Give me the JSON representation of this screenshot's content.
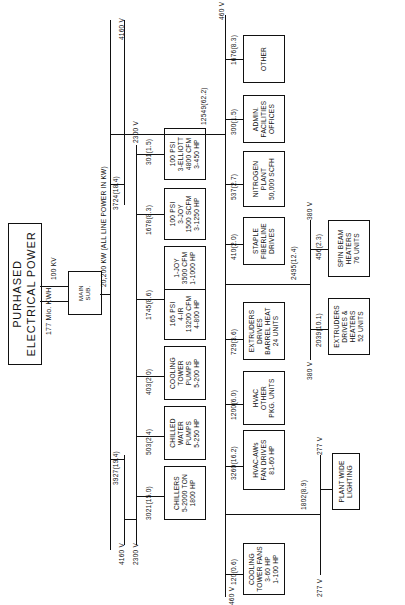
{
  "title": "PURHASED ELECTRICAL POWER",
  "subtitle": "177 Mio. KWH",
  "supply_voltage": "100 KV",
  "main_sub": "MAIN\nSUB.",
  "bus_label": "20,200 KW (ALL LINE POWER IN KW)",
  "voltages": {
    "v4160_top": "4160 V",
    "v4160_bottom": "4160 V",
    "v2300_left": "2300 V",
    "v2300_right": "2300 V",
    "v460_top": "460 V",
    "v460_bottom": "460 V",
    "v380_top": "380 V",
    "v380_bottom": "380 V",
    "v277_left": "277 V",
    "v277_right": "277 V"
  },
  "branch_4160": {
    "left": {
      "label": "3927(19.4)",
      "loads": [
        {
          "value": "3021(15.0)",
          "box": "CHILLERS\n5-2000 TON\n1800 HP"
        },
        {
          "value": "503(2.4)",
          "box": "CHILLED\nWATER\nPUMPS\n5-250 HP"
        },
        {
          "value": "403(2.0)",
          "box": "COOLING\nTOWER\nPUMPS\n5-200 HP"
        }
      ]
    },
    "right": {
      "label": "3724(18.4)",
      "loads": [
        {
          "value": "1745(8.6)",
          "box": "165 PSI\n4-IR\n13200 CFM\n4-800 HP",
          "box2": "1-JOY\n3500 CFM\n1-1000 HP"
        },
        {
          "value": "1678(8.3)",
          "box": "100 PSI\n3-JOY\n1500 SCFM\n3-1250 HP"
        },
        {
          "value": "301(1.5)",
          "box": "100 PSI\n3-ELLIOTT\n4800 CFM\n3-450 HP"
        }
      ]
    }
  },
  "branch_460": {
    "label": "12549(62.2)",
    "loads": [
      {
        "value": "120(0.6)",
        "box": "COOLING\nTOWER FANS\n3-60 HP\n1-100 HP"
      },
      {
        "value": "3260(16.2)",
        "box": "HVAC-AWs\nFAN DRIVES\n81-60 HP"
      },
      {
        "value": "1200(6.0)",
        "box": "HVAC\nOTHER\nPKG. UNITS"
      },
      {
        "value": "729(3.6)",
        "box": "EXTRUDERS\nDRIVES\nBARREL HEAT\n24 UNITS"
      },
      {
        "value": "410(2.0)",
        "box": "STAPLE\nFIBERLINE\nDRIVES"
      },
      {
        "value": "537(2.7)",
        "box": "NITROGEN\nPLANT\n50,000 SCFH"
      },
      {
        "value": "300(1.5)",
        "box": "ADMIN.\nFACILITIES\nOFFICES"
      },
      {
        "value": "1676(8.3)",
        "box": "OTHER"
      }
    ],
    "sub_277": {
      "value": "1802(8.9)",
      "box": "PLANT WIDE\nLIGHTING"
    },
    "sub_380": {
      "value": "2495(12.4)",
      "loads": [
        {
          "value": "2039(10.1)",
          "box": "EXTRUDERS\nDRIVES &\nHEATERS\n52 UNITS"
        },
        {
          "value": "456(2.3)",
          "box": "SPIN BEAM\nHEATERS\n76 UNITS"
        }
      ]
    }
  }
}
